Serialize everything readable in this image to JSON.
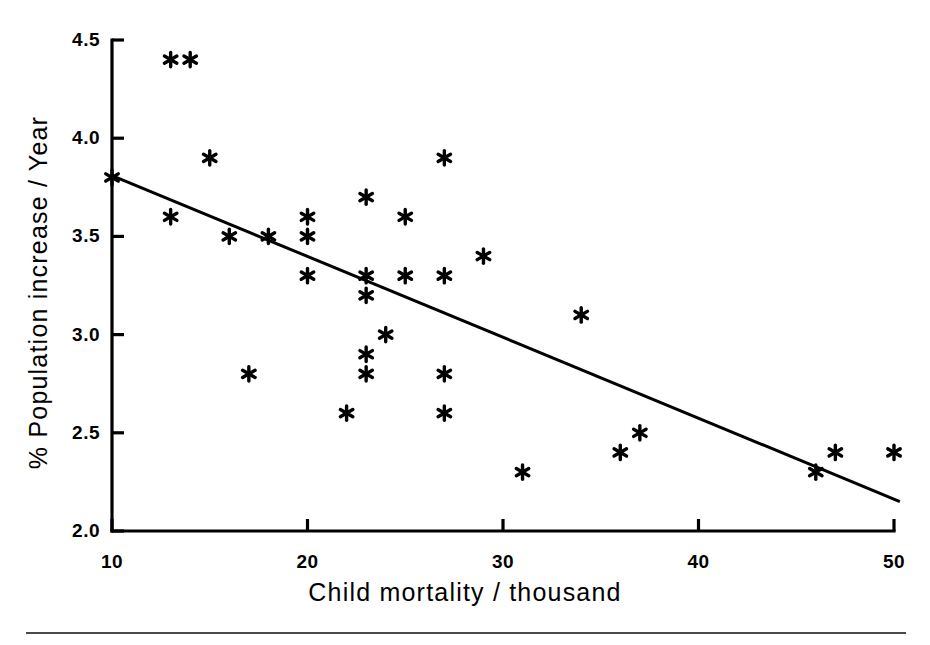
{
  "chart_data": {
    "type": "scatter",
    "title": "",
    "xlabel": "Child mortality / thousand",
    "ylabel": "% Population increase / Year",
    "xlim": [
      10,
      50
    ],
    "ylim": [
      2.0,
      4.5
    ],
    "xticks": [
      10,
      20,
      30,
      40,
      50
    ],
    "yticks": [
      "2.0",
      "2.5",
      "3.0",
      "3.5",
      "4.0",
      "4.5"
    ],
    "xtick_labels": [
      "10",
      "20",
      "30",
      "40",
      "50"
    ],
    "ytick_labels": [
      "2.0",
      "2.5",
      "3.0",
      "3.5",
      "4.0",
      "4.5"
    ],
    "grid": false,
    "legend": "none",
    "marker": "asterisk",
    "marker_color": "#000000",
    "line_color": "#000000",
    "axis_color": "#000000",
    "background": "#ffffff",
    "points": [
      {
        "x": 10,
        "y": 3.8
      },
      {
        "x": 13,
        "y": 4.4
      },
      {
        "x": 14,
        "y": 4.4
      },
      {
        "x": 13,
        "y": 3.6
      },
      {
        "x": 15,
        "y": 3.9
      },
      {
        "x": 16,
        "y": 3.5
      },
      {
        "x": 17,
        "y": 2.8
      },
      {
        "x": 18,
        "y": 3.5
      },
      {
        "x": 20,
        "y": 3.6
      },
      {
        "x": 20,
        "y": 3.5
      },
      {
        "x": 20,
        "y": 3.3
      },
      {
        "x": 22,
        "y": 2.6
      },
      {
        "x": 23,
        "y": 3.7
      },
      {
        "x": 23,
        "y": 3.3
      },
      {
        "x": 23,
        "y": 3.2
      },
      {
        "x": 23,
        "y": 2.9
      },
      {
        "x": 23,
        "y": 2.8
      },
      {
        "x": 24,
        "y": 3.0
      },
      {
        "x": 25,
        "y": 3.6
      },
      {
        "x": 25,
        "y": 3.3
      },
      {
        "x": 27,
        "y": 3.9
      },
      {
        "x": 27,
        "y": 3.3
      },
      {
        "x": 27,
        "y": 2.8
      },
      {
        "x": 27,
        "y": 2.6
      },
      {
        "x": 29,
        "y": 3.4
      },
      {
        "x": 31,
        "y": 2.3
      },
      {
        "x": 34,
        "y": 3.1
      },
      {
        "x": 36,
        "y": 2.4
      },
      {
        "x": 37,
        "y": 2.5
      },
      {
        "x": 46,
        "y": 2.3
      },
      {
        "x": 47,
        "y": 2.4
      },
      {
        "x": 50,
        "y": 2.4
      }
    ],
    "trendline": {
      "label": "regression-line",
      "x_start": 10,
      "y_start": 3.81,
      "x_end": 50.3,
      "y_end": 2.15
    }
  }
}
